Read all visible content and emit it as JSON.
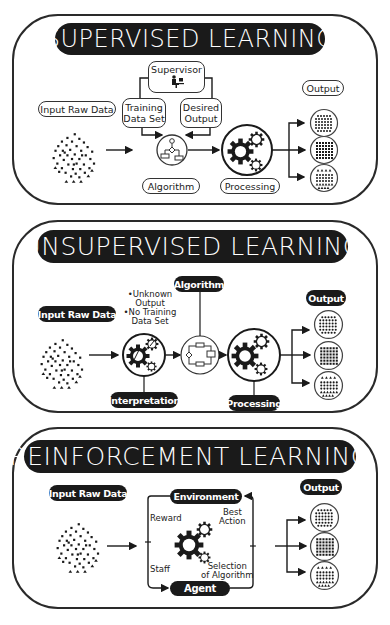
{
  "supervised": {
    "title": "SUPERVISED LEARNING",
    "supervisor_label": "Supervisor",
    "supervisor_icon": "person-at-computer-icon",
    "training_data_line1": "Training",
    "training_data_line2": "Data Set",
    "desired_output_line1": "Desired",
    "desired_output_line2": "Output",
    "input_label": "Input Raw Data",
    "algorithm_label": "Algorithm",
    "algorithm_icon": "flowchart-icon",
    "processing_label": "Processing",
    "processing_icon": "gears-icon",
    "output_label": "Output",
    "outputs": [
      "dot-grid-small",
      "dot-grid-square",
      "triangle-grid"
    ]
  },
  "unsupervised": {
    "title": "UNSUPERVISED LEARNING",
    "input_label": "Input Raw Data",
    "note_line1": "•Unknown",
    "note_line2": "Output",
    "note_line3": "•No Training",
    "note_line4": "Data Set",
    "interpretation_label": "Interpretation",
    "interpretation_icon": "gears-with-pencil-icon",
    "algorithm_label": "Algorithm",
    "algorithm_icon": "circuit-icon",
    "processing_label": "Processing",
    "processing_icon": "gears-icon",
    "output_label": "Output",
    "outputs": [
      "dot-grid-small",
      "dot-grid-square",
      "triangle-grid"
    ]
  },
  "reinforcement": {
    "title": "REINFORCEMENT LEARNING",
    "input_label": "Input Raw Data",
    "environment_label": "Environment",
    "agent_label": "Agent",
    "reward_label": "Reward",
    "best_action_line1": "Best",
    "best_action_line2": "Action",
    "staff_label": "Staff",
    "selection_line1": "Selection",
    "selection_line2": "of Algorithm",
    "center_icon": "gears-icon",
    "output_label": "Output",
    "outputs": [
      "dot-grid-small",
      "dot-grid-square",
      "triangle-grid"
    ]
  },
  "colors": {
    "ink": "#1a1a1a",
    "background": "#ffffff",
    "line": "#2a2a2a"
  }
}
